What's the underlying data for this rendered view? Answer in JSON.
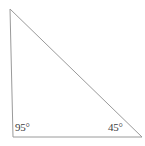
{
  "figure": {
    "type": "triangle-diagram",
    "background_color": "#ffffff",
    "stroke_color": "#9a9a9a",
    "stroke_width": 1,
    "label_color": "#3d3d3d",
    "canvas": {
      "width": 145,
      "height": 146
    },
    "vertices": {
      "apex": {
        "name": "top-vertex",
        "x": 10,
        "y": 9
      },
      "bottom_left": {
        "name": "bottom-left-vertex",
        "x": 13,
        "y": 137
      },
      "bottom_right": {
        "name": "bottom-right-vertex",
        "x": 142,
        "y": 137
      }
    },
    "polygon_points": "10,9 13,137 142,137",
    "labels": {
      "bottom_left_angle": "95°",
      "bottom_right_angle": "45°",
      "top_angle": ""
    }
  }
}
